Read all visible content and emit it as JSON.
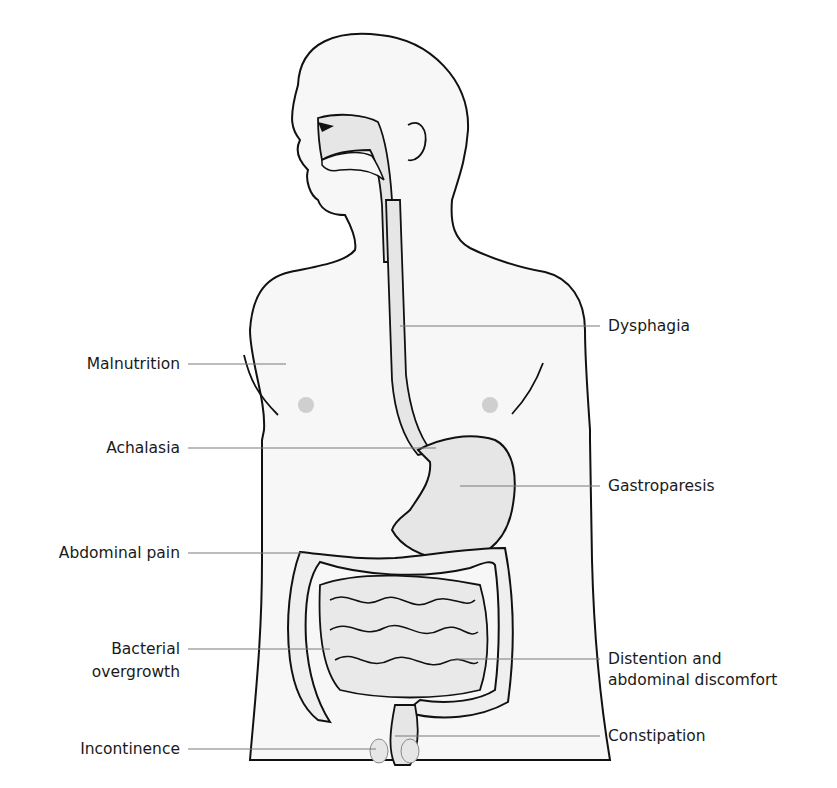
{
  "figure": {
    "colors": {
      "outline": "#111111",
      "body_fill": "#f7f7f7",
      "organ_fill": "#e6e6e6",
      "leader_line": "#7a7a7a",
      "nipple": "#c4c4c4",
      "text": "#1a1a1a"
    },
    "labels_left": [
      {
        "line1": "Malnutrition",
        "line2": ""
      },
      {
        "line1": "Achalasia",
        "line2": ""
      },
      {
        "line1": "Abdominal pain",
        "line2": ""
      },
      {
        "line1": "Bacterial",
        "line2": "overgrowth"
      },
      {
        "line1": "Incontinence",
        "line2": ""
      }
    ],
    "labels_right": [
      {
        "line1": "Dysphagia",
        "line2": ""
      },
      {
        "line1": "Gastroparesis",
        "line2": ""
      },
      {
        "line1": "Distention and",
        "line2": "abdominal discomfort"
      },
      {
        "line1": "Constipation",
        "line2": ""
      }
    ]
  }
}
